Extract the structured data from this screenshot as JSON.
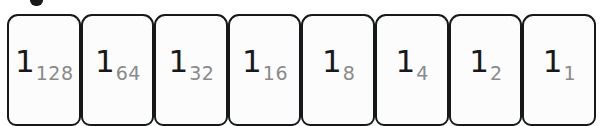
{
  "figure": {
    "name": "binary-place-value-row",
    "colors": {
      "page_background": "#ffffff",
      "cell_background": "#fcfcfc",
      "cell_border": "#16181a",
      "bit_value_text": "#17191b",
      "weight_subscript_text": "#8a8a8a"
    },
    "clipped_glyph_above": {
      "name": "clipped-glyph-fragment",
      "visible": true
    },
    "cells": [
      {
        "bit": "1",
        "weight": "128"
      },
      {
        "bit": "1",
        "weight": "64"
      },
      {
        "bit": "1",
        "weight": "32"
      },
      {
        "bit": "1",
        "weight": "16"
      },
      {
        "bit": "1",
        "weight": "8"
      },
      {
        "bit": "1",
        "weight": "4"
      },
      {
        "bit": "1",
        "weight": "2"
      },
      {
        "bit": "1",
        "weight": "1"
      }
    ]
  }
}
